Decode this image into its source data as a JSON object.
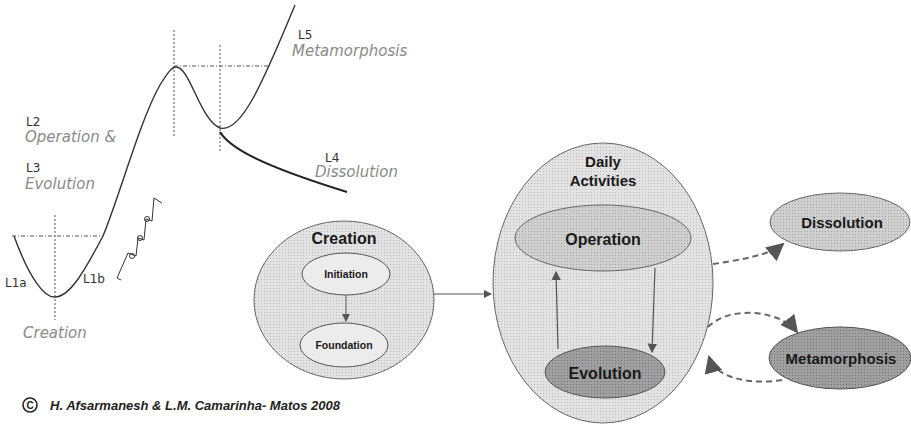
{
  "curve": {
    "labels": {
      "l1a": "L1a",
      "l1b": "L1b",
      "creation": "Creation",
      "l2": "L2",
      "operation": "Operation &",
      "l3": "L3",
      "evolution": "Evolution",
      "l4": "L4",
      "dissolution": "Dissolution",
      "l5": "L5",
      "metamorphosis": "Metamorphosis"
    }
  },
  "flow": {
    "creation": {
      "title": "Creation",
      "initiation": "Initiation",
      "foundation": "Foundation"
    },
    "daily": {
      "title_line1": "Daily",
      "title_line2": "Activities",
      "operation": "Operation",
      "evolution": "Evolution"
    },
    "dissolution": "Dissolution",
    "metamorphosis": "Metamorphosis"
  },
  "colors": {
    "light_fill": "#e6e6e6",
    "mid_fill": "#d2d2d2",
    "dark_fill": "#9c9c9c",
    "outer_fill": "#dcdcdc"
  },
  "copyright": "H. Afsarmanesh & L.M. Camarinha- Matos 2008"
}
